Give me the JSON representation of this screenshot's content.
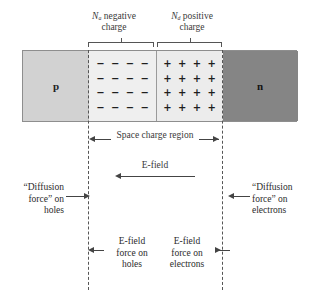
{
  "figure": {
    "top_labels": {
      "acceptor": {
        "symbol": "N",
        "subscript": "a",
        "line1_rest": " negative",
        "line2": "charge"
      },
      "donor": {
        "symbol": "N",
        "subscript": "d",
        "line1_rest": " positive",
        "line2": "charge"
      }
    },
    "regions": {
      "p_letter": "p",
      "n_letter": "n",
      "negative_sign": "−",
      "positive_sign": "+",
      "rows": 4,
      "cols": 4
    },
    "space_charge_label": "Space charge region",
    "efield_label": "E-field",
    "diffusion_holes": {
      "line1": "“Diffusion",
      "line2": "force” on",
      "line3": "holes"
    },
    "diffusion_electrons": {
      "line1": "“Diffusion",
      "line2": "force” on",
      "line3": "electrons"
    },
    "efield_force_holes": {
      "line1": "E-field",
      "line2": "force on",
      "line3": "holes"
    },
    "efield_force_electrons": {
      "line1": "E-field",
      "line2": "force on",
      "line3": "electrons"
    },
    "colors": {
      "p_region": "#d2d2d2",
      "depletion_negative": "#efefef",
      "depletion_positive": "#ececec",
      "n_region": "#858585",
      "outline": "#8e8e8e",
      "ink": "#3a3a3a"
    }
  }
}
